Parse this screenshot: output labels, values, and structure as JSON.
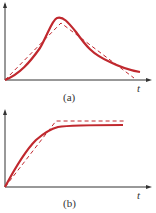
{
  "colors": {
    "curve": "#c0282e",
    "dashed": "#c0282e",
    "axis": "#333333"
  },
  "panels": [
    {
      "id": "a",
      "caption": "(a)",
      "axis_label": "t",
      "description": "Smooth peaked curve approximated by straight-line (dashed) segments rising then falling"
    },
    {
      "id": "b",
      "caption": "(b)",
      "axis_label": "t",
      "description": "Smooth saturating curve approximated by straight-line ramp then constant (dashed)"
    }
  ]
}
